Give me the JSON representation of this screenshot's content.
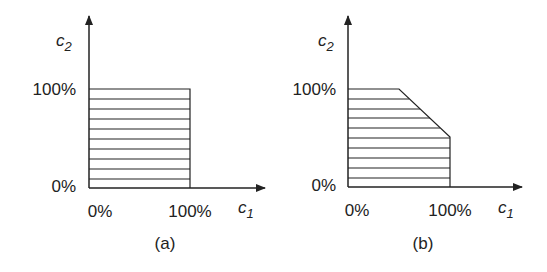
{
  "panels": [
    {
      "id": "a",
      "caption": "(a)",
      "y_axis_label": "c",
      "y_axis_sub": "2",
      "x_axis_label": "c",
      "x_axis_sub": "1",
      "y_ticks": [
        "100%",
        "0%"
      ],
      "x_ticks": [
        "0%",
        "100%"
      ],
      "region": "square: c1 0–100%, c2 0–100%"
    },
    {
      "id": "b",
      "caption": "(b)",
      "y_axis_label": "c",
      "y_axis_sub": "2",
      "x_axis_label": "c",
      "x_axis_sub": "1",
      "y_ticks": [
        "100%",
        "0%"
      ],
      "x_ticks": [
        "0%",
        "100%"
      ],
      "region": "pentagon: square with top-right corner cut from (50%,100%) to (100%,50%)"
    }
  ],
  "colors": {
    "line": "#222222",
    "background": "#ffffff"
  }
}
